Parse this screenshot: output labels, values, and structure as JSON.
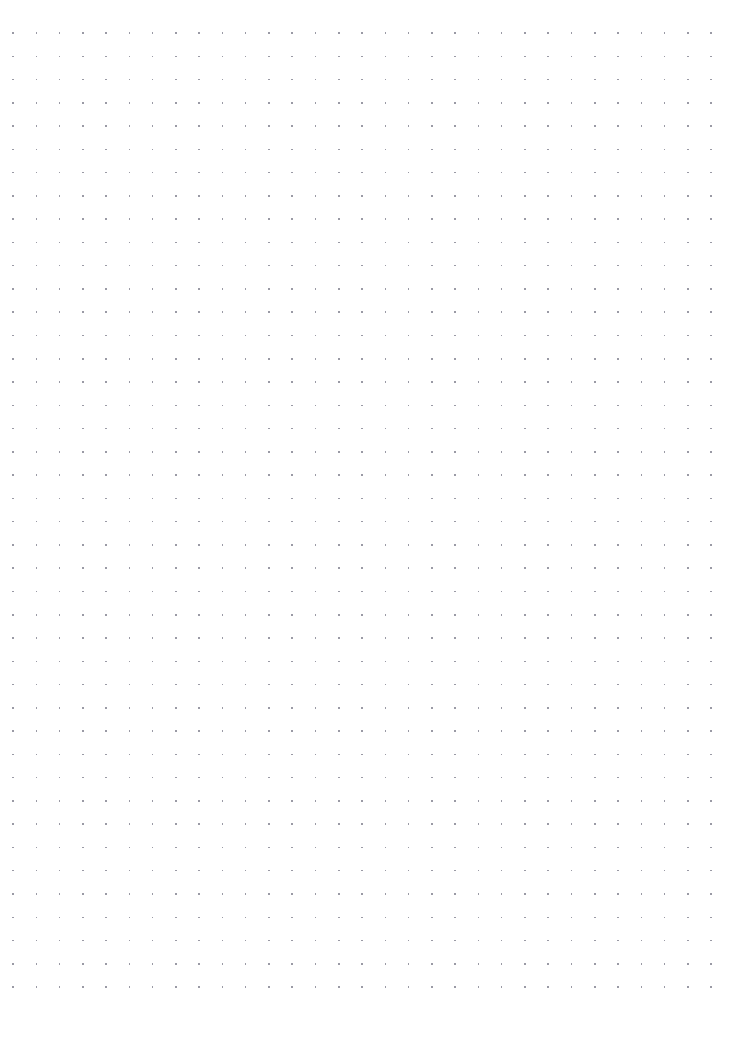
{
  "page": {
    "kind": "dot-grid-paper",
    "width_px": 754,
    "height_px": 1059,
    "background_color": "#ffffff",
    "content_text": "",
    "annotations": [],
    "headings": [],
    "labels": []
  },
  "grid": {
    "name": "dot-grid",
    "dot_color": "#9a9aa5",
    "dot_size_px": 1.5,
    "dot_shape": "square",
    "columns": 31,
    "rows": 42,
    "origin_x_px": 13,
    "origin_y_px": 33,
    "spacing_x_px": 23.27,
    "spacing_y_px": 23.27,
    "margin_left_px": 13,
    "margin_top_px": 33,
    "margin_right_px": 43,
    "margin_bottom_px": 63,
    "first_dot_px": [
      13,
      33
    ],
    "last_dot_px": [
      711,
      996
    ]
  }
}
